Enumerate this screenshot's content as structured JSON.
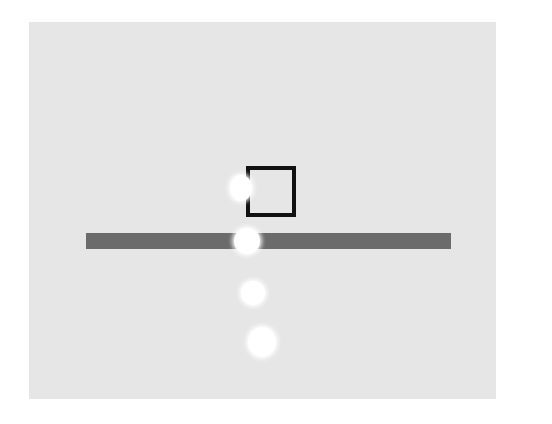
{
  "scene": {
    "background_color": "#ffffff",
    "panel_color": "#e6e6e6",
    "bar_color": "#6b6b6b",
    "box_color": "#111111",
    "blob_color": "#ffffff",
    "blobs": [
      {
        "cx": 241,
        "cy": 188,
        "rx": 11,
        "ry": 13
      },
      {
        "cx": 247,
        "cy": 241,
        "rx": 13,
        "ry": 13
      },
      {
        "cx": 253,
        "cy": 293,
        "rx": 12,
        "ry": 12
      },
      {
        "cx": 262,
        "cy": 342,
        "rx": 14,
        "ry": 15
      }
    ]
  }
}
